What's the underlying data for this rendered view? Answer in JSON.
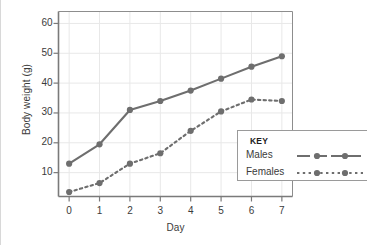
{
  "chart_data": {
    "type": "line",
    "title": "",
    "xlabel": "Day",
    "ylabel": "Body weight (g)",
    "x": [
      0,
      1,
      2,
      3,
      4,
      5,
      6,
      7
    ],
    "xticklabels": [
      "0",
      "1",
      "2",
      "3",
      "4",
      "5",
      "6",
      "7"
    ],
    "yticks": [
      10,
      20,
      30,
      40,
      50,
      60
    ],
    "yticklabels": [
      "10",
      "20",
      "30",
      "40",
      "50",
      "60"
    ],
    "xlim": [
      -0.35,
      7.35
    ],
    "ylim": [
      2,
      64
    ],
    "grid": true,
    "legend_position": "bottom-right",
    "legend_title": "KEY",
    "series": [
      {
        "name": "Males",
        "values": [
          13,
          19.5,
          31,
          34,
          37.5,
          41.5,
          45.5,
          49
        ],
        "linestyle": "solid",
        "marker": "circle",
        "color": "#6e6e6e"
      },
      {
        "name": "Females",
        "values": [
          3.5,
          6.5,
          13,
          16.5,
          24,
          30.5,
          34.5,
          34
        ],
        "linestyle": "dotted",
        "marker": "circle",
        "color": "#6e6e6e"
      }
    ]
  },
  "axes": {
    "y_title": "Body weight (g)",
    "x_title": "Day"
  },
  "legend": {
    "title": "KEY",
    "items": [
      {
        "label": "Males",
        "style": "solid-line-with-markers"
      },
      {
        "label": "Females",
        "style": "dotted-line-with-markers"
      }
    ]
  },
  "colors": {
    "series": "#6e6e6e",
    "axis": "#7a7a7a",
    "grid": "#e8e8e8",
    "text": "#3b3b3b",
    "legend_border": "#9a9a9a"
  }
}
